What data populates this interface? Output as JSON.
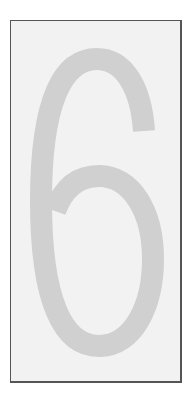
{
  "sign": {
    "digit": "6",
    "digit_color": "#d0d0d0",
    "background_color": "#f2f2f2",
    "border_color": "#555555"
  }
}
